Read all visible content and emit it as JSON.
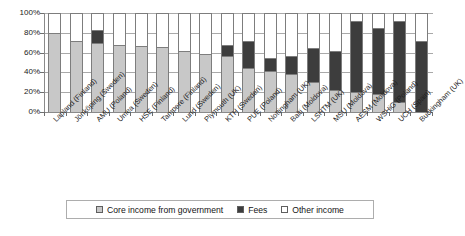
{
  "chart_data": {
    "type": "bar",
    "subtype": "stacked-percentage",
    "title": "",
    "xlabel": "",
    "ylabel": "",
    "ylim": [
      0,
      100
    ],
    "yticks": [
      "0%",
      "20%",
      "40%",
      "60%",
      "80%",
      "100%"
    ],
    "ytick_values": [
      0,
      20,
      40,
      60,
      80,
      100
    ],
    "grid": true,
    "legend_position": "bottom",
    "categories": [
      "Lapland (Finland)",
      "Jönköping (Sweden)",
      "AMU (Poland)",
      "Umea (Sweden)",
      "HSE (Finland)",
      "Tampere (Finland)",
      "Lund (Sweden)",
      "Plymouth (UK)",
      "KTH (Sweden)",
      "PUE (Poland)",
      "Nottingham (UK)",
      "Balti (Moldova)",
      "LSHTM (UK)",
      "MSU (Moldova)",
      "AESM (Moldova)",
      "WSHiG (Poland)",
      "UCH (Spain)",
      "Buckingham (UK)"
    ],
    "series": [
      {
        "name": "Core income from government",
        "color": "#c8c8c8",
        "values": [
          80,
          72,
          70,
          68,
          67,
          66,
          62,
          59,
          57,
          44,
          41,
          38,
          30,
          22,
          20,
          18,
          10,
          0
        ]
      },
      {
        "name": "Fees",
        "color": "#3d3d3d",
        "values": [
          0,
          0,
          13,
          0,
          0,
          0,
          0,
          0,
          11,
          28,
          14,
          19,
          35,
          40,
          72,
          67,
          82,
          72
        ]
      },
      {
        "name": "Other income",
        "color": "#ffffff",
        "values": [
          20,
          28,
          17,
          32,
          33,
          34,
          38,
          41,
          32,
          28,
          45,
          43,
          35,
          38,
          8,
          15,
          8,
          28
        ]
      }
    ]
  },
  "legend": {
    "items": [
      {
        "label": "Core income from government",
        "swatch": "sw-core"
      },
      {
        "label": "Fees",
        "swatch": "sw-fees"
      },
      {
        "label": "Other income",
        "swatch": "sw-other"
      }
    ]
  }
}
